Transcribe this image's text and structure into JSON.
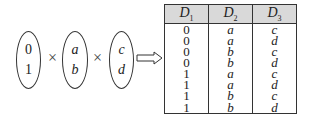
{
  "sets": [
    {
      "name": "D1",
      "elements": [
        "0",
        "1"
      ]
    },
    {
      "name": "D2",
      "elements": [
        "a",
        "b"
      ]
    },
    {
      "name": "D3",
      "elements": [
        "c",
        "d"
      ]
    }
  ],
  "operators": {
    "times": "×",
    "result_arrow": "⟹"
  },
  "table": {
    "headers": [
      {
        "base": "D",
        "sub": "1"
      },
      {
        "base": "D",
        "sub": "2"
      },
      {
        "base": "D",
        "sub": "3"
      }
    ],
    "rows": [
      [
        "0",
        "a",
        "c"
      ],
      [
        "0",
        "a",
        "d"
      ],
      [
        "0",
        "b",
        "c"
      ],
      [
        "0",
        "b",
        "d"
      ],
      [
        "1",
        "a",
        "c"
      ],
      [
        "1",
        "a",
        "d"
      ],
      [
        "1",
        "b",
        "c"
      ],
      [
        "1",
        "b",
        "d"
      ]
    ],
    "header_bg": "#d9d9d9"
  }
}
